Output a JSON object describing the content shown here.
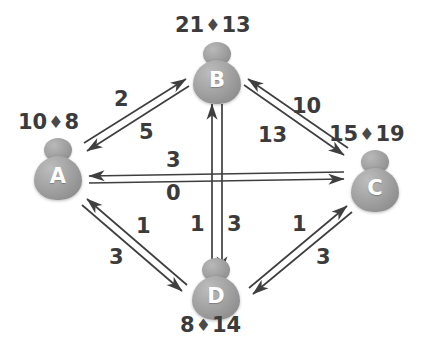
{
  "diagram": {
    "background_color": "#ffffff",
    "line_color": "#3f3f3f",
    "node_color": "#9d9d9d",
    "node_letter_color": "#ffffff",
    "text_color": "#3b3b3b",
    "separator_glyph": "♦"
  },
  "nodes": [
    {
      "id": "A",
      "label": "A",
      "values": {
        "left": "10",
        "right": "8",
        "separator": "♦"
      },
      "values_text": "10 ♦ 8"
    },
    {
      "id": "B",
      "label": "B",
      "values": {
        "left": "21",
        "right": "13",
        "separator": "♦"
      },
      "values_text": "21 ♦ 13"
    },
    {
      "id": "C",
      "label": "C",
      "values": {
        "left": "15",
        "right": "19",
        "separator": "♦"
      },
      "values_text": "15 ♦ 19"
    },
    {
      "id": "D",
      "label": "D",
      "values": {
        "left": "8",
        "right": "14",
        "separator": "♦"
      },
      "values_text": "8 ♦ 14"
    }
  ],
  "edges": [
    {
      "id": "a-b",
      "from": "A",
      "to": "B",
      "weight_outer": "2",
      "weight_inner": "5"
    },
    {
      "id": "b-c",
      "from": "B",
      "to": "C",
      "weight_outer": "10",
      "weight_inner": "13"
    },
    {
      "id": "a-c",
      "from": "A",
      "to": "C",
      "weight_outer": "3",
      "weight_inner": "0"
    },
    {
      "id": "b-d",
      "from": "B",
      "to": "D",
      "weight_outer": "1",
      "weight_inner": "3"
    },
    {
      "id": "a-d",
      "from": "A",
      "to": "D",
      "weight_outer": "1",
      "weight_inner": "3"
    },
    {
      "id": "c-d",
      "from": "C",
      "to": "D",
      "weight_outer": "1",
      "weight_inner": "3"
    }
  ],
  "edge_labels": {
    "ab_upper": "2",
    "ab_lower": "5",
    "bc_upper": "10",
    "bc_lower": "13",
    "ac_upper": "3",
    "ac_lower": "0",
    "bd_left": "1",
    "bd_right": "3",
    "ad_upper": "1",
    "ad_lower": "3",
    "cd_upper": "1",
    "cd_lower": "3"
  }
}
